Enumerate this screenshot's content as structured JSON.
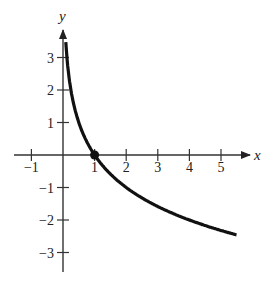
{
  "chart_data": {
    "type": "line",
    "title": "",
    "function": "y = log_{1/2}(x)",
    "xlabel": "x",
    "ylabel": "y",
    "xlim": [
      -1.5,
      5.8
    ],
    "ylim": [
      -3.6,
      3.8
    ],
    "x_ticks": [
      -1,
      1,
      2,
      3,
      4,
      5
    ],
    "x_tick_labels": [
      "−1",
      "1",
      "2",
      "3",
      "4",
      "5"
    ],
    "y_ticks": [
      3,
      2,
      1,
      -1,
      -2,
      -3
    ],
    "y_tick_labels": [
      "3",
      "2",
      "1",
      "−1",
      "−2",
      "−3"
    ],
    "grid": false,
    "legend": null,
    "series": [
      {
        "name": "curve",
        "x": [
          0.09,
          0.125,
          0.25,
          0.5,
          1,
          2,
          3,
          4,
          5,
          5.5
        ],
        "y": [
          3.5,
          3,
          2,
          1,
          0,
          -1,
          -1.58,
          -2,
          -2.32,
          -2.46
        ]
      }
    ],
    "marked_point": {
      "x": 1,
      "y": 0
    }
  }
}
